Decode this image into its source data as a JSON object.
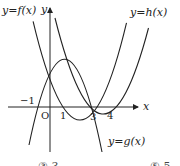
{
  "figure": {
    "curve_labels": {
      "f": "y=f(x)",
      "g": "y=g(x)",
      "h": "y=h(x)"
    },
    "axis_labels": {
      "x": "x",
      "y": "y",
      "origin": "O"
    },
    "tick_labels": {
      "neg1": "−1",
      "one": "1",
      "three": "3",
      "four": "4"
    },
    "curves": [
      {
        "name": "f",
        "type": "parabola-up",
        "roots": [
          1,
          3
        ]
      },
      {
        "name": "g",
        "type": "parabola-down",
        "roots": [
          -1,
          3
        ]
      },
      {
        "name": "h",
        "type": "parabola-up",
        "roots": [
          3,
          4
        ]
      }
    ],
    "stroke_color": "#222222"
  },
  "answer_choices": {
    "left": "③ 3",
    "right": "⑤ 5"
  }
}
